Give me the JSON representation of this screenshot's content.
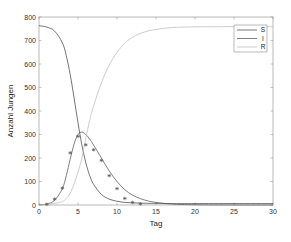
{
  "chart_data": {
    "type": "line",
    "title": "",
    "xlabel": "Tag",
    "ylabel": "Anzahl Jungen",
    "xlim": [
      0,
      30
    ],
    "ylim": [
      0,
      800
    ],
    "xticks": [
      0,
      5,
      10,
      15,
      20,
      25,
      30
    ],
    "yticks": [
      0,
      100,
      200,
      300,
      400,
      500,
      600,
      700,
      800
    ],
    "grid": false,
    "legend_position": "upper right",
    "series": [
      {
        "name": "S",
        "color": "#3a3a3a",
        "x": [
          0,
          1,
          2,
          3,
          3.5,
          4,
          4.5,
          5,
          5.5,
          6,
          6.5,
          7,
          8,
          9,
          10,
          11,
          12,
          13,
          14,
          15,
          17,
          20,
          25,
          30
        ],
        "values": [
          763,
          757,
          740,
          690,
          635,
          555,
          455,
          350,
          255,
          180,
          125,
          88,
          45,
          25,
          16,
          11,
          9,
          8,
          7,
          7,
          6,
          6,
          6,
          6
        ]
      },
      {
        "name": "I",
        "color": "#4a4a4a",
        "x": [
          0,
          1,
          2,
          3,
          3.5,
          4,
          4.5,
          5,
          5.5,
          6,
          6.5,
          7,
          8,
          9,
          10,
          11,
          12,
          13,
          14,
          15,
          17,
          20,
          25,
          30
        ],
        "values": [
          1,
          4,
          20,
          70,
          125,
          195,
          260,
          300,
          310,
          300,
          280,
          255,
          200,
          145,
          100,
          65,
          42,
          27,
          17,
          11,
          4,
          1,
          0,
          0
        ]
      },
      {
        "name": "R",
        "color": "#b8b8b8",
        "x": [
          0,
          1,
          2,
          3,
          3.5,
          4,
          4.5,
          5,
          5.5,
          6,
          6.5,
          7,
          8,
          9,
          10,
          11,
          12,
          13,
          14,
          15,
          17,
          20,
          25,
          30
        ],
        "values": [
          0,
          3,
          7,
          15,
          28,
          50,
          90,
          140,
          200,
          285,
          360,
          422,
          520,
          595,
          649,
          689,
          714,
          730,
          741,
          747,
          755,
          758,
          759,
          759
        ]
      },
      {
        "name": "Daten",
        "style": "markers",
        "marker": "asterisk",
        "color": "#555555",
        "x": [
          1,
          2,
          3,
          4,
          5,
          6,
          7,
          8,
          9,
          10,
          11,
          12,
          13
        ],
        "values": [
          3,
          25,
          72,
          222,
          292,
          256,
          235,
          190,
          125,
          70,
          28,
          11,
          5
        ]
      }
    ],
    "legend_entries": [
      "S",
      "I",
      "R"
    ]
  }
}
